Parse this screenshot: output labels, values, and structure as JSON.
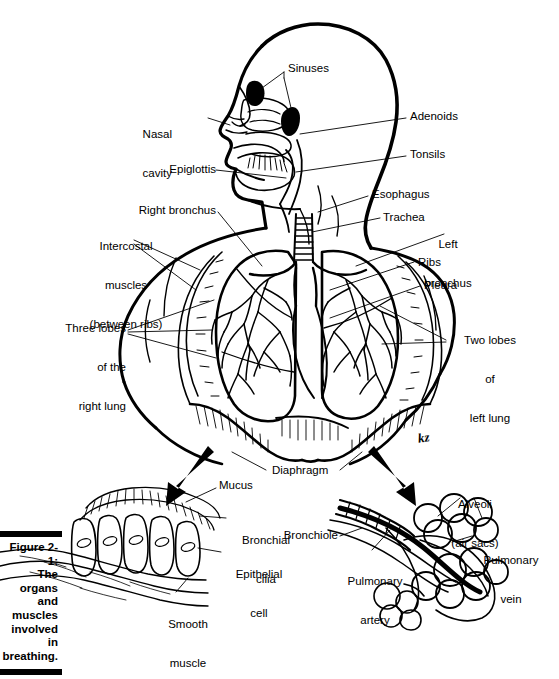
{
  "figure": {
    "caption_label": "Figure 2-1:",
    "caption_lines": [
      "The organs",
      "and",
      "muscles",
      "involved in",
      "breathing."
    ],
    "caption_full": "Figure 2-1: The organs and muscles involved in breathing.",
    "artist_signature": "kz"
  },
  "diagram": {
    "title": "The organs and muscles involved in breathing",
    "type": "anatomical-illustration",
    "view": "head in left profile, torso frontal with lungs, plus two detail insets"
  },
  "labels": {
    "head": [
      {
        "id": "sinuses",
        "text": "Sinuses",
        "align": "left",
        "x": 288,
        "y": 68
      },
      {
        "id": "nasal-cavity",
        "text": "Nasal\ncavity",
        "lines": [
          "Nasal",
          "cavity"
        ],
        "align": "right",
        "x": 170,
        "y": 108
      },
      {
        "id": "adenoids",
        "text": "Adenoids",
        "align": "left",
        "x": 410,
        "y": 115
      },
      {
        "id": "tonsils",
        "text": "Tonsils",
        "align": "left",
        "x": 410,
        "y": 153
      },
      {
        "id": "epiglottis",
        "text": "Epiglottis",
        "align": "right",
        "x": 163,
        "y": 167
      },
      {
        "id": "esophagus",
        "text": "Esophagus",
        "align": "left",
        "x": 372,
        "y": 192
      }
    ],
    "thorax": [
      {
        "id": "right-bronchus",
        "text": "Right bronchus",
        "align": "right",
        "x": 163,
        "y": 208
      },
      {
        "id": "trachea",
        "text": "Trachea",
        "align": "left",
        "x": 383,
        "y": 214
      },
      {
        "id": "left-bronchus",
        "text": "Left\nbronchus",
        "lines": [
          "Left",
          "bronchus"
        ],
        "align": "center",
        "x": 448,
        "y": 220
      },
      {
        "id": "intercostal-muscles",
        "text": "Intercostal\nmuscles\n(between ribs)",
        "lines": [
          "Intercostal",
          "muscles",
          "(between ribs)"
        ],
        "align": "center",
        "x": 63,
        "y": 218
      },
      {
        "id": "ribs",
        "text": "Ribs",
        "align": "left",
        "x": 418,
        "y": 259
      },
      {
        "id": "pleura",
        "text": "Pleura",
        "align": "left",
        "x": 424,
        "y": 282
      },
      {
        "id": "three-lobes-right-lung",
        "text": "Three lobes\nof the\nright lung",
        "lines": [
          "Three lobes",
          "of the",
          "right lung"
        ],
        "align": "right",
        "x": 50,
        "y": 300
      },
      {
        "id": "two-lobes-left-lung",
        "text": "Two lobes\nof\nleft lung",
        "lines": [
          "Two lobes",
          "of",
          "left lung"
        ],
        "align": "center",
        "x": 450,
        "y": 312
      },
      {
        "id": "diaphragm",
        "text": "Diaphragm",
        "align": "left",
        "x": 269,
        "y": 468
      }
    ],
    "inset_left": {
      "name": "bronchial-lining-detail",
      "items": [
        {
          "id": "mucus",
          "text": "Mucus",
          "align": "left",
          "x": 219,
          "y": 483
        },
        {
          "id": "bronchial-cilia",
          "text": "Bronchial\ncilia",
          "lines": [
            "Bronchial",
            "cilia"
          ],
          "align": "center",
          "x": 229,
          "y": 514
        },
        {
          "id": "epithelial-cell",
          "text": "Epithelial\ncell",
          "lines": [
            "Epithelial",
            "cell"
          ],
          "align": "center",
          "x": 224,
          "y": 548
        },
        {
          "id": "smooth-muscle",
          "text": "Smooth\nmuscle",
          "lines": [
            "Smooth",
            "muscle"
          ],
          "align": "center",
          "x": 163,
          "y": 596
        }
      ]
    },
    "inset_right": {
      "name": "alveoli-detail",
      "items": [
        {
          "id": "alveoli",
          "text": "Alveoli\n(air sacs)",
          "lines": [
            "Alveoli",
            "(air sacs)"
          ],
          "align": "center",
          "x": 468,
          "y": 477
        },
        {
          "id": "bronchiole",
          "text": "Bronchiole",
          "align": "right",
          "x": 294,
          "y": 533
        },
        {
          "id": "pulmonary-vein",
          "text": "Pulmonary\nvein",
          "lines": [
            "Pulmonary",
            "vein"
          ],
          "align": "center",
          "x": 476,
          "y": 533
        },
        {
          "id": "pulmonary-artery",
          "text": "Pulmonary\nartery",
          "lines": [
            "Pulmonary",
            "artery"
          ],
          "align": "center",
          "x": 352,
          "y": 554
        }
      ]
    }
  },
  "colors": {
    "ink": "#000000",
    "paper": "#ffffff"
  }
}
